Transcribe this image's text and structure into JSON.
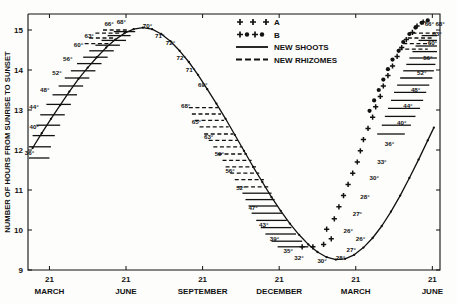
{
  "figure": {
    "background": "#fdfdfc",
    "ink": "#111111",
    "width": 457,
    "height": 304
  },
  "axes": {
    "y_label": "NUMBER OF HOURS FROM SUNRISE TO SUNSET",
    "y_ticks": [
      "9",
      "10",
      "11",
      "12",
      "13",
      "14",
      "15"
    ],
    "y_values": [
      9,
      10,
      11,
      12,
      13,
      14,
      15
    ],
    "ylim": [
      9,
      15.4
    ],
    "x_tick_label": "21",
    "x_ticks": [
      "21",
      "21",
      "21",
      "21",
      "21",
      "21"
    ],
    "x_months": [
      "MARCH",
      "JUNE",
      "SEPTEMBER",
      "DECEMBER",
      "MARCH",
      "JUNE"
    ],
    "x_positions": [
      0,
      1,
      2,
      3,
      4,
      5
    ],
    "xlim": [
      -0.28,
      5.1
    ],
    "grid": false
  },
  "legend": {
    "position": "top-center",
    "entries": [
      {
        "label": "A",
        "marker": "plus-plus-plus",
        "glyph": "+  +  +"
      },
      {
        "label": "B",
        "marker": "plus-dot-plus-dot",
        "glyph": "+ • + •"
      },
      {
        "label": "NEW SHOOTS",
        "marker": "solid-line"
      },
      {
        "label": "NEW RHIZOMES",
        "marker": "dashed-line"
      }
    ]
  },
  "chart_data": {
    "type": "line",
    "title": "",
    "xlabel": "",
    "ylabel": "NUMBER OF HOURS FROM SUNRISE TO SUNSET",
    "xlim": [
      -0.28,
      5.1
    ],
    "ylim": [
      9,
      15.4
    ],
    "grid": false,
    "categories": [
      "MARCH 21",
      "JUNE 21",
      "SEPTEMBER 21",
      "DECEMBER 21",
      "MARCH 21",
      "JUNE 21"
    ],
    "series": [
      {
        "name": "day length curve",
        "style": "solid-line-with-dots",
        "x": [
          -0.22,
          -0.1,
          0.02,
          0.14,
          0.26,
          0.38,
          0.5,
          0.62,
          0.74,
          0.86,
          0.98,
          1.1,
          1.22,
          1.34,
          1.46,
          1.58,
          1.7,
          1.82,
          1.94,
          2.06,
          2.18,
          2.3,
          2.42,
          2.54,
          2.66,
          2.78,
          2.9,
          3.02,
          3.14,
          3.26,
          3.38,
          3.5,
          3.62,
          3.74,
          3.86,
          3.98,
          4.1,
          4.22,
          4.34,
          4.46,
          4.58,
          4.7,
          4.82,
          4.94,
          5.02
        ],
        "y": [
          12.05,
          12.42,
          12.78,
          13.12,
          13.46,
          13.78,
          14.06,
          14.32,
          14.56,
          14.76,
          14.92,
          15.02,
          15.06,
          15.02,
          14.9,
          14.72,
          14.48,
          14.2,
          13.88,
          13.52,
          13.16,
          12.78,
          12.38,
          11.98,
          11.58,
          11.2,
          10.82,
          10.48,
          10.16,
          9.88,
          9.64,
          9.45,
          9.32,
          9.26,
          9.28,
          9.38,
          9.56,
          9.8,
          10.1,
          10.46,
          10.86,
          11.3,
          11.76,
          12.24,
          12.56
        ]
      }
    ],
    "temperature_labels_left_ascending": [
      "36°",
      "40°",
      "44°",
      "48°",
      "52°",
      "56°",
      "60°",
      "63°",
      "66°",
      "68°",
      "70°"
    ],
    "temperature_labels_descending": [
      "71°",
      "72°",
      "72°",
      "71°",
      "69°",
      "68°",
      "65°",
      "63°",
      "59°",
      "56°",
      "52°",
      "47°",
      "43°",
      "39°",
      "35°",
      "32°",
      "30°"
    ],
    "temperature_labels_right_ascending": [
      "28°",
      "26°",
      "27°",
      "28°",
      "30°",
      "33°",
      "36°",
      "40°",
      "44°",
      "48°",
      "52°",
      "56°",
      "60°",
      "63°",
      "66°",
      "68°"
    ],
    "annotations": [
      {
        "text": "36°",
        "x": -0.2,
        "y": 11.88,
        "anchor": "end"
      },
      {
        "text": "40°",
        "x": -0.26,
        "y": 12.52,
        "anchor": "start"
      },
      {
        "text": "44°",
        "x": -0.14,
        "y": 13.02,
        "anchor": "end"
      },
      {
        "text": "48°",
        "x": 0.0,
        "y": 13.46,
        "anchor": "end"
      },
      {
        "text": "52°",
        "x": 0.16,
        "y": 13.88,
        "anchor": "end"
      },
      {
        "text": "56°",
        "x": 0.3,
        "y": 14.22,
        "anchor": "end"
      },
      {
        "text": "60°",
        "x": 0.44,
        "y": 14.58,
        "anchor": "end"
      },
      {
        "text": "63°",
        "x": 0.58,
        "y": 14.8,
        "anchor": "end"
      },
      {
        "text": "66°",
        "x": 0.84,
        "y": 15.1,
        "anchor": "end"
      },
      {
        "text": "68°",
        "x": 1.0,
        "y": 15.14,
        "anchor": "end"
      },
      {
        "text": "70°",
        "x": 1.22,
        "y": 15.06,
        "anchor": "start"
      },
      {
        "text": "71°",
        "x": 1.38,
        "y": 14.8,
        "anchor": "start"
      },
      {
        "text": "72°",
        "x": 1.52,
        "y": 14.62,
        "anchor": "start"
      },
      {
        "text": "72°",
        "x": 1.66,
        "y": 14.26,
        "anchor": "start"
      },
      {
        "text": "71°",
        "x": 1.78,
        "y": 13.96,
        "anchor": "start"
      },
      {
        "text": "69°",
        "x": 1.94,
        "y": 13.58,
        "anchor": "start"
      },
      {
        "text": "68°",
        "x": 1.84,
        "y": 13.06,
        "anchor": "end"
      },
      {
        "text": "65°",
        "x": 1.98,
        "y": 12.66,
        "anchor": "end"
      },
      {
        "text": "63°",
        "x": 2.14,
        "y": 12.28,
        "anchor": "end"
      },
      {
        "text": "59°",
        "x": 2.28,
        "y": 11.86,
        "anchor": "end"
      },
      {
        "text": "56°",
        "x": 2.42,
        "y": 11.42,
        "anchor": "end"
      },
      {
        "text": "52°",
        "x": 2.56,
        "y": 11.0,
        "anchor": "end"
      },
      {
        "text": "47°",
        "x": 2.72,
        "y": 10.5,
        "anchor": "end"
      },
      {
        "text": "43°",
        "x": 2.86,
        "y": 10.08,
        "anchor": "end"
      },
      {
        "text": "39°",
        "x": 3.0,
        "y": 9.72,
        "anchor": "end"
      },
      {
        "text": "35°",
        "x": 3.18,
        "y": 9.42,
        "anchor": "end"
      },
      {
        "text": "32°",
        "x": 3.32,
        "y": 9.26,
        "anchor": "end"
      },
      {
        "text": "30°",
        "x": 3.56,
        "y": 9.18,
        "anchor": "middle"
      },
      {
        "text": "28°",
        "x": 3.74,
        "y": 9.26,
        "anchor": "start"
      },
      {
        "text": "27°",
        "x": 3.88,
        "y": 9.46,
        "anchor": "start"
      },
      {
        "text": "26°",
        "x": 4.0,
        "y": 9.72,
        "anchor": "start"
      },
      {
        "text": "26°",
        "x": 3.84,
        "y": 9.92,
        "anchor": "start"
      },
      {
        "text": "27°",
        "x": 3.96,
        "y": 10.36,
        "anchor": "start"
      },
      {
        "text": "28°",
        "x": 4.06,
        "y": 10.78,
        "anchor": "start"
      },
      {
        "text": "30°",
        "x": 4.18,
        "y": 11.24,
        "anchor": "start"
      },
      {
        "text": "33°",
        "x": 4.28,
        "y": 11.64,
        "anchor": "start"
      },
      {
        "text": "36°",
        "x": 4.38,
        "y": 12.1,
        "anchor": "start"
      },
      {
        "text": "40°",
        "x": 4.54,
        "y": 12.62,
        "anchor": "start"
      },
      {
        "text": "44°",
        "x": 4.62,
        "y": 13.04,
        "anchor": "start"
      },
      {
        "text": "48°",
        "x": 4.72,
        "y": 13.44,
        "anchor": "start"
      },
      {
        "text": "52°",
        "x": 4.8,
        "y": 13.88,
        "anchor": "start"
      },
      {
        "text": "56°",
        "x": 4.88,
        "y": 14.24,
        "anchor": "start"
      },
      {
        "text": "60°",
        "x": 4.94,
        "y": 14.62,
        "anchor": "start"
      },
      {
        "text": "63°",
        "x": 5.0,
        "y": 14.86,
        "anchor": "start"
      },
      {
        "text": "66°",
        "x": 4.9,
        "y": 15.1,
        "anchor": "start"
      },
      {
        "text": "68°",
        "x": 5.04,
        "y": 15.1,
        "anchor": "start"
      }
    ],
    "new_shoots_bars": [
      {
        "x1": -0.27,
        "x2": 0.0,
        "y": 11.8
      },
      {
        "x1": -0.27,
        "x2": 0.02,
        "y": 12.08
      },
      {
        "x1": -0.22,
        "x2": 0.07,
        "y": 12.36
      },
      {
        "x1": -0.17,
        "x2": 0.14,
        "y": 12.62
      },
      {
        "x1": -0.12,
        "x2": 0.2,
        "y": 12.88
      },
      {
        "x1": -0.04,
        "x2": 0.28,
        "y": 13.14
      },
      {
        "x1": 0.04,
        "x2": 0.36,
        "y": 13.38
      },
      {
        "x1": 0.12,
        "x2": 0.44,
        "y": 13.6
      },
      {
        "x1": 0.2,
        "x2": 0.52,
        "y": 13.8
      },
      {
        "x1": 0.28,
        "x2": 0.6,
        "y": 13.98
      },
      {
        "x1": 0.36,
        "x2": 0.68,
        "y": 14.16
      },
      {
        "x1": 0.44,
        "x2": 0.76,
        "y": 14.32
      },
      {
        "x1": 0.52,
        "x2": 0.84,
        "y": 14.48
      },
      {
        "x1": 0.6,
        "x2": 0.92,
        "y": 14.62
      },
      {
        "x1": 0.68,
        "x2": 1.0,
        "y": 14.74
      },
      {
        "x1": 0.76,
        "x2": 1.06,
        "y": 14.86
      },
      {
        "x1": 0.84,
        "x2": 1.12,
        "y": 14.96
      },
      {
        "x1": 2.52,
        "x2": 2.9,
        "y": 10.92
      },
      {
        "x1": 2.56,
        "x2": 2.94,
        "y": 10.76
      },
      {
        "x1": 2.6,
        "x2": 2.98,
        "y": 10.6
      },
      {
        "x1": 2.64,
        "x2": 3.04,
        "y": 10.42
      },
      {
        "x1": 2.7,
        "x2": 3.1,
        "y": 10.24
      },
      {
        "x1": 2.76,
        "x2": 3.16,
        "y": 10.06
      },
      {
        "x1": 2.82,
        "x2": 3.22,
        "y": 9.9
      },
      {
        "x1": 2.9,
        "x2": 3.3,
        "y": 9.72
      },
      {
        "x1": 2.98,
        "x2": 3.38,
        "y": 9.58
      },
      {
        "x1": 4.28,
        "x2": 4.64,
        "y": 12.4
      },
      {
        "x1": 4.34,
        "x2": 4.72,
        "y": 12.62
      },
      {
        "x1": 4.38,
        "x2": 4.78,
        "y": 12.84
      },
      {
        "x1": 4.42,
        "x2": 4.84,
        "y": 13.04
      },
      {
        "x1": 4.46,
        "x2": 4.88,
        "y": 13.24
      },
      {
        "x1": 4.5,
        "x2": 4.92,
        "y": 13.44
      },
      {
        "x1": 4.54,
        "x2": 4.96,
        "y": 13.62
      },
      {
        "x1": 4.58,
        "x2": 5.0,
        "y": 13.8
      },
      {
        "x1": 4.62,
        "x2": 5.02,
        "y": 13.98
      },
      {
        "x1": 4.66,
        "x2": 5.04,
        "y": 14.14
      },
      {
        "x1": 4.7,
        "x2": 5.06,
        "y": 14.3
      },
      {
        "x1": 4.74,
        "x2": 5.06,
        "y": 14.46
      },
      {
        "x1": 4.78,
        "x2": 5.06,
        "y": 14.6
      },
      {
        "x1": 4.82,
        "x2": 5.06,
        "y": 14.74
      },
      {
        "x1": 4.86,
        "x2": 5.06,
        "y": 14.86
      }
    ],
    "new_rhizome_bars": [
      {
        "x1": 0.46,
        "x2": 0.8,
        "y": 14.66
      },
      {
        "x1": 0.52,
        "x2": 0.86,
        "y": 14.8
      },
      {
        "x1": 0.6,
        "x2": 0.94,
        "y": 14.92
      },
      {
        "x1": 0.7,
        "x2": 1.02,
        "y": 15.0
      },
      {
        "x1": 1.82,
        "x2": 2.2,
        "y": 13.06
      },
      {
        "x1": 1.86,
        "x2": 2.24,
        "y": 12.9
      },
      {
        "x1": 1.9,
        "x2": 2.28,
        "y": 12.74
      },
      {
        "x1": 1.96,
        "x2": 2.34,
        "y": 12.58
      },
      {
        "x1": 2.02,
        "x2": 2.4,
        "y": 12.4
      },
      {
        "x1": 2.08,
        "x2": 2.46,
        "y": 12.24
      },
      {
        "x1": 2.14,
        "x2": 2.52,
        "y": 12.08
      },
      {
        "x1": 2.2,
        "x2": 2.58,
        "y": 11.9
      },
      {
        "x1": 2.26,
        "x2": 2.64,
        "y": 11.74
      },
      {
        "x1": 2.3,
        "x2": 2.7,
        "y": 11.58
      },
      {
        "x1": 2.36,
        "x2": 2.74,
        "y": 11.42
      },
      {
        "x1": 2.42,
        "x2": 2.8,
        "y": 11.26
      },
      {
        "x1": 2.46,
        "x2": 2.86,
        "y": 11.08
      },
      {
        "x1": 4.56,
        "x2": 4.94,
        "y": 14.52
      },
      {
        "x1": 4.62,
        "x2": 4.98,
        "y": 14.66
      },
      {
        "x1": 4.68,
        "x2": 5.02,
        "y": 14.8
      },
      {
        "x1": 4.74,
        "x2": 5.06,
        "y": 14.92
      }
    ],
    "plus_markers": [
      {
        "x": 3.3,
        "y": 9.58
      },
      {
        "x": 3.44,
        "y": 9.58
      },
      {
        "x": 3.58,
        "y": 9.64
      },
      {
        "x": 3.68,
        "y": 9.78
      },
      {
        "x": 3.62,
        "y": 10.02
      },
      {
        "x": 3.72,
        "y": 10.28
      },
      {
        "x": 3.78,
        "y": 10.58
      },
      {
        "x": 3.84,
        "y": 10.86
      },
      {
        "x": 3.9,
        "y": 11.14
      },
      {
        "x": 3.96,
        "y": 11.42
      },
      {
        "x": 4.02,
        "y": 11.7
      },
      {
        "x": 4.06,
        "y": 11.98
      },
      {
        "x": 4.1,
        "y": 12.26
      },
      {
        "x": 4.16,
        "y": 12.54
      },
      {
        "x": 4.22,
        "y": 12.82
      },
      {
        "x": 4.26,
        "y": 13.08
      },
      {
        "x": 4.32,
        "y": 13.34
      },
      {
        "x": 4.36,
        "y": 13.6
      },
      {
        "x": 4.42,
        "y": 13.86
      },
      {
        "x": 4.48,
        "y": 14.1
      },
      {
        "x": 4.54,
        "y": 14.34
      },
      {
        "x": 4.6,
        "y": 14.56
      },
      {
        "x": 4.66,
        "y": 14.76
      },
      {
        "x": 4.74,
        "y": 14.94
      },
      {
        "x": 4.8,
        "y": 15.1
      },
      {
        "x": 4.88,
        "y": 15.2
      }
    ],
    "dot_markers": [
      {
        "x": 4.18,
        "y": 12.98
      },
      {
        "x": 4.24,
        "y": 13.24
      },
      {
        "x": 4.3,
        "y": 13.5
      },
      {
        "x": 4.36,
        "y": 13.76
      },
      {
        "x": 4.42,
        "y": 14.02
      },
      {
        "x": 4.48,
        "y": 14.26
      },
      {
        "x": 4.56,
        "y": 14.48
      },
      {
        "x": 4.62,
        "y": 14.7
      },
      {
        "x": 4.7,
        "y": 14.9
      },
      {
        "x": 4.78,
        "y": 15.06
      },
      {
        "x": 4.86,
        "y": 15.18
      },
      {
        "x": 4.94,
        "y": 15.24
      }
    ]
  }
}
